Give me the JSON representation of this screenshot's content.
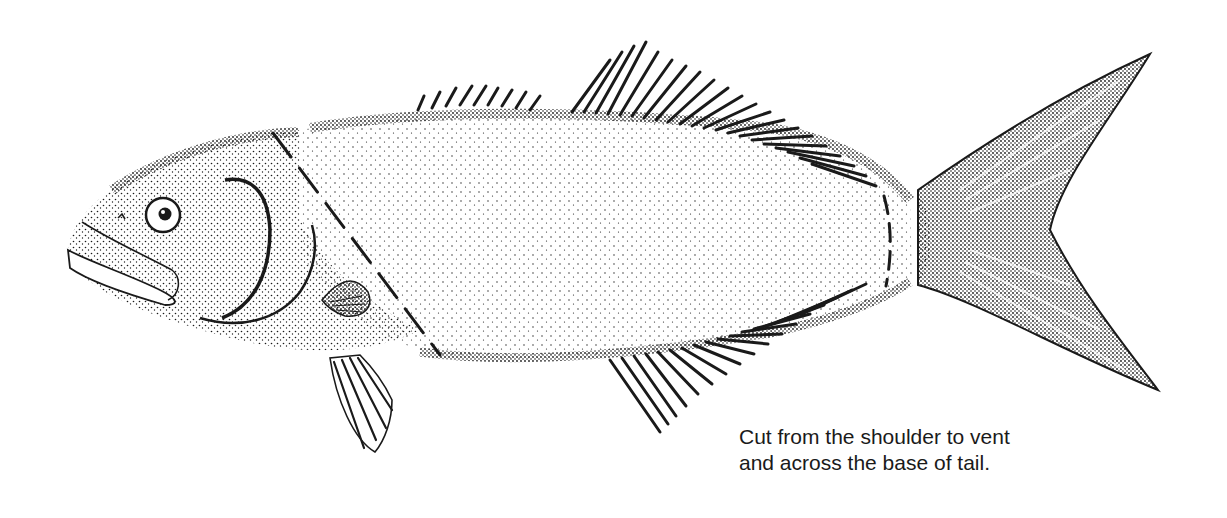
{
  "figure": {
    "caption": {
      "line1": "Cut from the shoulder to vent",
      "line2": "and across the base of tail."
    },
    "colors": {
      "ink": "#1a1a1a",
      "background": "#ffffff"
    }
  }
}
